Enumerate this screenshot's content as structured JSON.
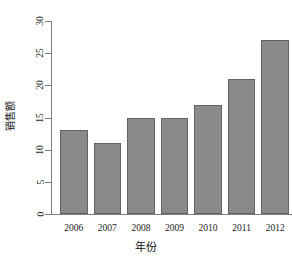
{
  "chart_data": {
    "type": "bar",
    "title": "",
    "subtitle": "",
    "xlabel": "年份",
    "ylabel": "销售额",
    "categories": [
      "2006",
      "2007",
      "2008",
      "2009",
      "2010",
      "2011",
      "2012"
    ],
    "values": [
      13,
      11,
      15,
      15,
      17,
      21,
      27
    ],
    "series": [
      {
        "name": "销售额",
        "values": [
          13,
          11,
          15,
          15,
          17,
          21,
          27
        ]
      }
    ],
    "ylim": [
      0,
      30
    ],
    "y_ticks": [
      0,
      5,
      10,
      15,
      20,
      25,
      30
    ],
    "y_tick_labels": [
      "0",
      "5",
      "10",
      "15",
      "20",
      "25",
      "30"
    ],
    "y_tick_label_rotation": 90,
    "x_ticks": [
      "2006",
      "2007",
      "2008",
      "2009",
      "2010",
      "2011",
      "2012"
    ],
    "grid": false,
    "legend": false,
    "legend_position": "none",
    "bar_fill_color": "#8a8a8a",
    "bar_border_color": "#636363",
    "axis_color": "#7d7d7d",
    "background_color": "#ffffff",
    "text_color": "#1a1a1a"
  }
}
